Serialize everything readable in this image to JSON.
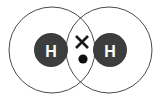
{
  "canvas": {
    "width": 160,
    "height": 101,
    "background": "#ffffff"
  },
  "diagram": {
    "type": "covalent-bond-dot-and-cross",
    "molecule": "H2",
    "bond_type": "single covalent bond",
    "shared_electron_pair_count": 2
  },
  "shells": {
    "stroke_color": "#4a4a4a",
    "stroke_width": 1,
    "fill": "none",
    "radius": 43,
    "left": {
      "cx": 52,
      "cy": 50,
      "label": "left-electron-shell"
    },
    "right": {
      "cx": 109,
      "cy": 50,
      "label": "right-electron-shell"
    }
  },
  "atoms": [
    {
      "id": "left",
      "symbol": "H",
      "element": "hydrogen",
      "cx": 51,
      "cy": 50,
      "r": 17,
      "fill": "#3d3d3d",
      "text_color": "#ffffff",
      "font_size": 16
    },
    {
      "id": "right",
      "symbol": "H",
      "element": "hydrogen",
      "cx": 110,
      "cy": 50,
      "r": 17,
      "fill": "#3d3d3d",
      "text_color": "#ffffff",
      "font_size": 16
    }
  ],
  "shared_electrons": {
    "cross": {
      "name": "electron-cross-marker",
      "cx": 82,
      "cy": 42,
      "arm": 6,
      "stroke_color": "#1a1a1a",
      "stroke_width": 2.6,
      "belongs_to": "right atom"
    },
    "dot": {
      "name": "electron-dot-marker",
      "cx": 83,
      "cy": 59,
      "r": 4.6,
      "fill": "#111111",
      "belongs_to": "left atom"
    }
  },
  "overlap_region": {
    "name": "bonding-overlap-lens",
    "top_intersection": {
      "x": 80,
      "y": 22
    },
    "bottom_intersection": {
      "x": 81,
      "y": 78
    },
    "left_extent": 66,
    "right_extent": 95
  },
  "colors": {
    "shell_outline": "#4a4a4a",
    "nucleus_fill": "#3d3d3d",
    "nucleus_text": "#ffffff",
    "electron_ink": "#111111",
    "background": "#ffffff"
  }
}
